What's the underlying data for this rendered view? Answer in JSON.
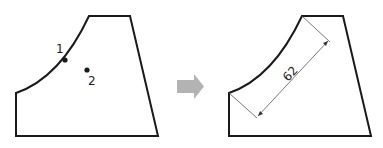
{
  "left_figure": {
    "point_1_label": "1",
    "point_2_label": "2"
  },
  "arrow": {
    "direction": "right",
    "color": "#b3b3b3"
  },
  "right_figure": {
    "dimension_value": "62"
  },
  "colors": {
    "outline": "#1a1a1a",
    "dimension_line": "#555555"
  }
}
